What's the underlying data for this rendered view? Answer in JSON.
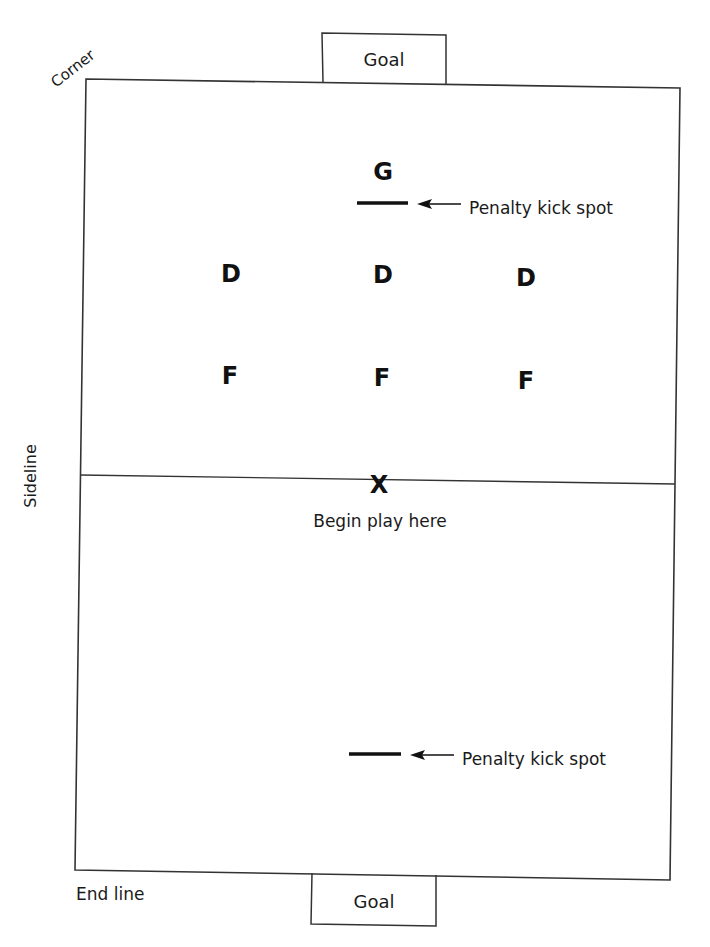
{
  "labels": {
    "corner": "Corner",
    "sideline": "Sideline",
    "end_line": "End line",
    "goal_top": "Goal",
    "goal_bottom": "Goal",
    "penalty_top": "Penalty kick spot",
    "penalty_bottom": "Penalty kick spot",
    "begin_play": "Begin play here",
    "center_mark": "X"
  },
  "positions": {
    "goalie": {
      "label": "G"
    },
    "defenders": [
      {
        "label": "D"
      },
      {
        "label": "D"
      },
      {
        "label": "D"
      }
    ],
    "forwards": [
      {
        "label": "F"
      },
      {
        "label": "F"
      },
      {
        "label": "F"
      }
    ]
  },
  "colors": {
    "line": "#333333",
    "text": "#1a1a1a"
  }
}
